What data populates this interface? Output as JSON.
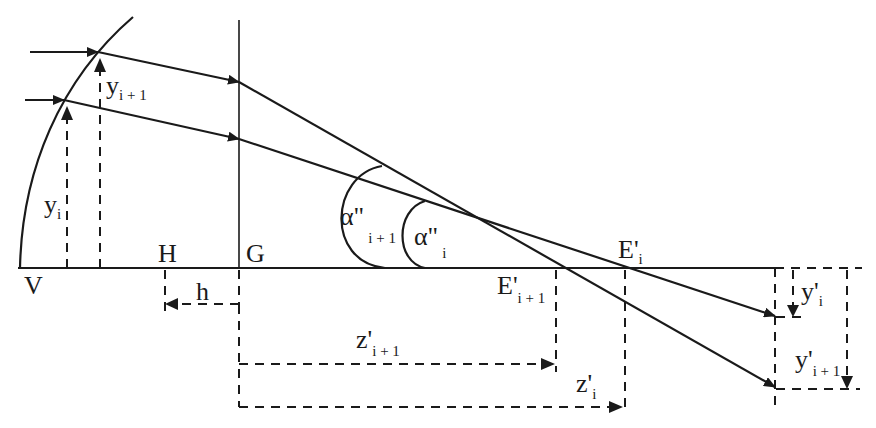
{
  "diagram": {
    "type": "optical ray diagram",
    "labels": {
      "V": "V",
      "H": "H",
      "G": "G",
      "h": "h",
      "y_i": {
        "main": "y",
        "sub": "i"
      },
      "y_i1": {
        "main": "y",
        "sub": "i + 1"
      },
      "alpha_i1": {
        "main": "α\"",
        "sub": "i + 1"
      },
      "alpha_i": {
        "main": "α\"",
        "sub": "i"
      },
      "E_i": {
        "main": "E'",
        "sub": "i"
      },
      "E_i1": {
        "main": "E'",
        "sub": "i + 1"
      },
      "z_i1": {
        "main": "z'",
        "sub": "i + 1"
      },
      "z_i": {
        "main": "z'",
        "sub": "i"
      },
      "yp_i": {
        "main": "y'",
        "sub": "i"
      },
      "yp_i1": {
        "main": "y'",
        "sub": "i + 1"
      }
    },
    "colors": {
      "ink": "#1a1a1a",
      "background": "#ffffff"
    }
  }
}
